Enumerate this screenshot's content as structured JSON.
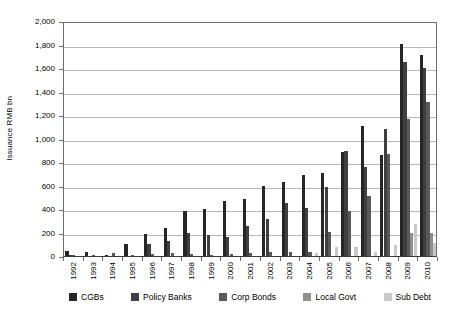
{
  "chart_data": {
    "type": "bar",
    "title": "",
    "xlabel": "",
    "ylabel": "Issuance RMB bn",
    "ylim": [
      0,
      2000
    ],
    "ytick_values": [
      0,
      200,
      400,
      600,
      800,
      1000,
      1200,
      1400,
      1600,
      1800,
      2000
    ],
    "ytick_labels": [
      "0",
      "200",
      "400",
      "600",
      "800",
      "1,000",
      "1,200",
      "1,400",
      "1,600",
      "1,800",
      "2,000"
    ],
    "grid": true,
    "legend_position": "bottom",
    "categories": [
      "1992",
      "1993",
      "1994",
      "1995",
      "1996",
      "1997",
      "1998",
      "1999",
      "2000",
      "2001",
      "2002",
      "2003",
      "2004",
      "2005",
      "2006",
      "2007",
      "2008",
      "2009",
      "2010"
    ],
    "series": [
      {
        "name": "CGBs",
        "color": "#262626",
        "values": [
          39,
          31,
          11,
          101,
          185,
          241,
          381,
          401,
          466,
          488,
          593,
          628,
          692,
          704,
          888,
          1110,
          856,
          1803,
          1712
        ]
      },
      {
        "name": "Policy Banks",
        "color": "#3f3f3f",
        "values": [
          5,
          0,
          0,
          0,
          106,
          132,
          195,
          182,
          165,
          259,
          312,
          448,
          412,
          585,
          896,
          757,
          1080,
          1655,
          1603
        ]
      },
      {
        "name": "Corp Bonds",
        "color": "#595959",
        "values": [
          7,
          5,
          23,
          5,
          18,
          27,
          15,
          12,
          18,
          22,
          32,
          36,
          33,
          206,
          387,
          511,
          872,
          1169,
          1310
        ]
      },
      {
        "name": "Local Govt",
        "color": "#8f8f8f",
        "values": [
          0,
          0,
          0,
          0,
          0,
          0,
          0,
          0,
          0,
          0,
          0,
          0,
          0,
          0,
          0,
          0,
          0,
          200,
          200
        ]
      },
      {
        "name": "Sub Debt",
        "color": "#c9c9c9",
        "values": [
          0,
          0,
          0,
          0,
          0,
          0,
          0,
          0,
          0,
          0,
          0,
          0,
          25,
          75,
          80,
          30,
          95,
          270,
          110
        ]
      }
    ]
  }
}
